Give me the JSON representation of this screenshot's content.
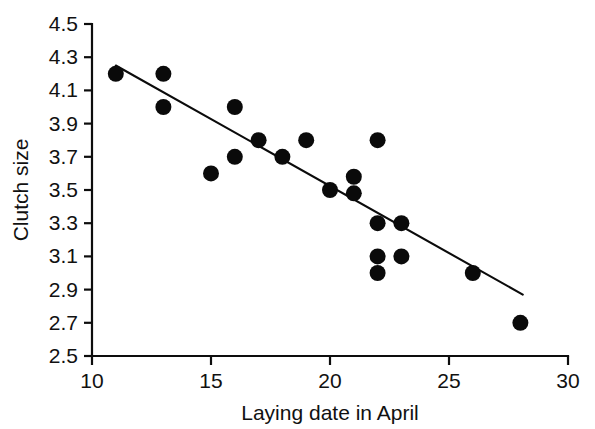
{
  "chart_data": {
    "type": "scatter",
    "title": "",
    "subtitle": "",
    "xlabel": "Laying date in April",
    "ylabel": "Clutch size",
    "xlim": [
      10,
      30
    ],
    "ylim": [
      2.5,
      4.5
    ],
    "xticks": [
      10,
      15,
      20,
      25,
      30
    ],
    "xtick_labels": [
      "10",
      "15",
      "20",
      "25",
      "30"
    ],
    "yticks": [
      2.5,
      2.7,
      2.9,
      3.1,
      3.3,
      3.5,
      3.7,
      3.9,
      4.1,
      4.3,
      4.5
    ],
    "ytick_labels": [
      "2.5",
      "2.7",
      "2.9",
      "3.1",
      "3.3",
      "3.5",
      "3.7",
      "3.9",
      "4.1",
      "4.3",
      "4.5"
    ],
    "grid": false,
    "legend": false,
    "legend_position": "none",
    "marker": "filled-circle",
    "marker_color": "#0a0a0a",
    "marker_size_px": 16,
    "series": [
      {
        "name": "Observations",
        "x": [
          11,
          13,
          13,
          15,
          16,
          16,
          17,
          18,
          19,
          20,
          21,
          21,
          22,
          22,
          22,
          22,
          22,
          23,
          23,
          26,
          28
        ],
        "y": [
          4.2,
          4.2,
          4.0,
          3.6,
          4.0,
          3.7,
          3.8,
          3.7,
          3.8,
          3.5,
          3.55,
          3.5,
          3.8,
          3.3,
          3.1,
          3.02,
          3.5,
          3.3,
          3.1,
          3.0,
          2.7
        ],
        "points": [
          {
            "x": 11,
            "y": 4.2
          },
          {
            "x": 13,
            "y": 4.2
          },
          {
            "x": 13,
            "y": 4.0
          },
          {
            "x": 15,
            "y": 3.6
          },
          {
            "x": 16,
            "y": 4.0
          },
          {
            "x": 16,
            "y": 3.7
          },
          {
            "x": 17,
            "y": 3.8
          },
          {
            "x": 18,
            "y": 3.7
          },
          {
            "x": 19,
            "y": 3.8
          },
          {
            "x": 20,
            "y": 3.5
          },
          {
            "x": 21,
            "y": 3.58
          },
          {
            "x": 21,
            "y": 3.48
          },
          {
            "x": 22,
            "y": 3.8
          },
          {
            "x": 22,
            "y": 3.3
          },
          {
            "x": 22,
            "y": 3.1
          },
          {
            "x": 22,
            "y": 3.0
          },
          {
            "x": 23,
            "y": 3.3
          },
          {
            "x": 23,
            "y": 3.1
          },
          {
            "x": 26,
            "y": 3.0
          },
          {
            "x": 28,
            "y": 2.7
          }
        ]
      }
    ],
    "fit_line": {
      "name": "Linear regression",
      "x_start": 11.0,
      "y_start": 4.25,
      "x_end": 28.1,
      "y_end": 2.87,
      "color": "#0b0b0b"
    }
  }
}
